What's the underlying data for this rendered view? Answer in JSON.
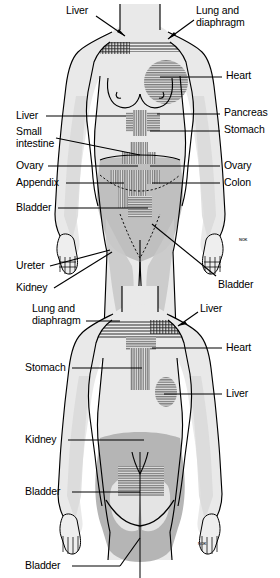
{
  "illustration": {
    "title": "Referred pain patterns — anterior and posterior views",
    "colors": {
      "skin_fill": "#e9e9e9",
      "shadow_fill": "#b9b9b9",
      "mid_fill": "#d2d2d2",
      "outline": "#000000",
      "hatch": "#4a4a4a",
      "label_text": "#000000",
      "leader_line": "#000000",
      "background": "#ffffff"
    },
    "signature": "NOK"
  },
  "anterior_view": {
    "name": "anterior-figure",
    "labels": [
      {
        "id": "liver-top",
        "text": "Liver",
        "side": "left",
        "x": 66,
        "y": 9,
        "leader": "arrow"
      },
      {
        "id": "lung-diaphragm",
        "text": "Lung and\ndiaphragm",
        "side": "right",
        "x": 196,
        "y": 9,
        "leader": "arrow"
      },
      {
        "id": "heart",
        "text": "Heart",
        "side": "right",
        "x": 224,
        "y": 71,
        "leader": "line"
      },
      {
        "id": "liver-left",
        "text": "Liver",
        "side": "left",
        "x": 16,
        "y": 111,
        "leader": "line"
      },
      {
        "id": "pancreas",
        "text": "Pancreas",
        "side": "right",
        "x": 222,
        "y": 108,
        "leader": "line"
      },
      {
        "id": "small-intestine",
        "text": "Small\nintestine",
        "side": "left",
        "x": 16,
        "y": 127,
        "leader": "line"
      },
      {
        "id": "stomach-ant",
        "text": "Stomach",
        "side": "right",
        "x": 222,
        "y": 126,
        "leader": "line"
      },
      {
        "id": "ovary-left",
        "text": "Ovary",
        "side": "left",
        "x": 16,
        "y": 161,
        "leader": "line"
      },
      {
        "id": "ovary-right",
        "text": "Ovary",
        "side": "right",
        "x": 222,
        "y": 161,
        "leader": "line"
      },
      {
        "id": "appendix",
        "text": "Appendix",
        "side": "left",
        "x": 16,
        "y": 178,
        "leader": "line"
      },
      {
        "id": "colon",
        "text": "Colon",
        "side": "right",
        "x": 222,
        "y": 178,
        "leader": "line"
      },
      {
        "id": "bladder-ant",
        "text": "Bladder",
        "side": "left",
        "x": 16,
        "y": 203,
        "leader": "line"
      },
      {
        "id": "ureter",
        "text": "Ureter",
        "side": "left",
        "x": 16,
        "y": 262,
        "leader": "line"
      },
      {
        "id": "kidney-ant",
        "text": "Kidney",
        "side": "left",
        "x": 16,
        "y": 283,
        "leader": "line"
      },
      {
        "id": "bladder-ant-2",
        "text": "Bladder",
        "side": "right",
        "x": 218,
        "y": 281,
        "leader": "line"
      }
    ]
  },
  "posterior_view": {
    "name": "posterior-figure",
    "labels": [
      {
        "id": "lung-diaphragm-post",
        "text": "Lung and\ndiaphragm",
        "side": "left",
        "x": 32,
        "y": 305,
        "leader": "line"
      },
      {
        "id": "liver-post-top",
        "text": "Liver",
        "side": "right",
        "x": 200,
        "y": 305,
        "leader": "arrow"
      },
      {
        "id": "heart-post",
        "text": "Heart",
        "side": "right",
        "x": 224,
        "y": 343,
        "leader": "line"
      },
      {
        "id": "stomach-post",
        "text": "Stomach",
        "side": "left",
        "x": 25,
        "y": 362,
        "leader": "line"
      },
      {
        "id": "liver-post",
        "text": "Liver",
        "side": "right",
        "x": 224,
        "y": 389,
        "leader": "line"
      },
      {
        "id": "kidney-post",
        "text": "Kidney",
        "side": "left",
        "x": 25,
        "y": 434,
        "leader": "line"
      },
      {
        "id": "bladder-post",
        "text": "Bladder",
        "side": "left",
        "x": 25,
        "y": 486,
        "leader": "line"
      },
      {
        "id": "bladder-post-2",
        "text": "Bladder",
        "side": "left",
        "x": 25,
        "y": 561,
        "leader": "line"
      }
    ]
  },
  "organs_marked": [
    "Liver",
    "Lung and diaphragm",
    "Heart",
    "Pancreas",
    "Stomach",
    "Small intestine",
    "Ovary",
    "Appendix",
    "Colon",
    "Bladder",
    "Ureter",
    "Kidney"
  ]
}
